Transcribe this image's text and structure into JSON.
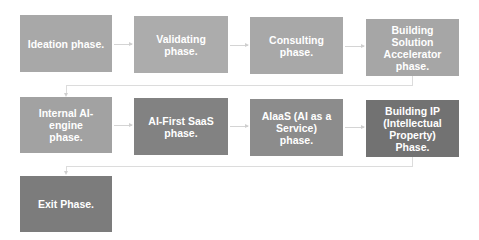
{
  "diagram": {
    "type": "flowchart",
    "colors": {
      "background": "#ffffff",
      "connector": "#d4d4d4",
      "text": "#ffffff"
    },
    "phases": [
      {
        "label": "Ideation phase.",
        "color": "#a8a8a8"
      },
      {
        "label": "Validating phase.",
        "color": "#acacac"
      },
      {
        "label": "Consulting phase.",
        "color": "#a8a8a8"
      },
      {
        "label": "Building Solution Accelerator phase.",
        "color": "#a6a6a6"
      },
      {
        "label": "Internal AI-engine phase.",
        "color": "#a2a2a2"
      },
      {
        "label": "AI-First SaaS phase.",
        "color": "#828282"
      },
      {
        "label": "AIaaS (AI as a Service) phase.",
        "color": "#8c8c8c"
      },
      {
        "label": "Building IP (Intellectual Property) Phase.",
        "color": "#727272"
      },
      {
        "label": "Exit Phase.",
        "color": "#7c7c7c"
      }
    ]
  }
}
